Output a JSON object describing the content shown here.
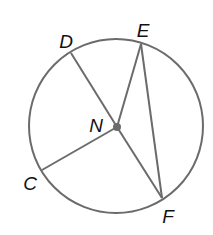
{
  "diagram": {
    "type": "circle-with-center-and-segments",
    "colors": {
      "stroke": "#6b6b6b",
      "center_dot": "#6b6b6b",
      "label": "#111111",
      "background": "#ffffff"
    },
    "circle": {
      "cx": 116,
      "cy": 126,
      "r": 87
    },
    "center": {
      "name": "N",
      "x": 117,
      "y": 127,
      "dot_r": 4
    },
    "points": [
      {
        "name": "D",
        "x": 71,
        "y": 53,
        "label_x": 66,
        "label_y": 41
      },
      {
        "name": "E",
        "x": 141,
        "y": 44,
        "label_x": 143,
        "label_y": 30
      },
      {
        "name": "C",
        "x": 42,
        "y": 170,
        "label_x": 30,
        "label_y": 183
      },
      {
        "name": "F",
        "x": 162,
        "y": 198,
        "label_x": 168,
        "label_y": 216
      }
    ],
    "center_label": {
      "text": "N",
      "x": 96,
      "y": 125
    },
    "segments": [
      {
        "from": "N",
        "to": "D"
      },
      {
        "from": "N",
        "to": "E"
      },
      {
        "from": "N",
        "to": "C"
      },
      {
        "from": "N",
        "to": "F"
      },
      {
        "from": "E",
        "to": "F"
      }
    ],
    "labels": {
      "D": "D",
      "E": "E",
      "N": "N",
      "C": "C",
      "F": "F"
    }
  }
}
